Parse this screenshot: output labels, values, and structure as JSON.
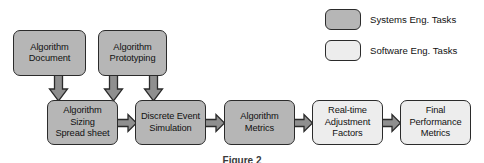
{
  "diagram": {
    "title_caption": "Figure 2",
    "legend": {
      "items": [
        {
          "label": "Systems Eng. Tasks",
          "swatch": "systems",
          "color": "#b6b6b6"
        },
        {
          "label": "Software Eng. Tasks",
          "swatch": "software",
          "color": "#ededed"
        }
      ]
    },
    "nodes": [
      {
        "id": "algorithm-document",
        "label": "Algorithm\nDocument",
        "category": "systems",
        "x": 13,
        "y": 30,
        "w": 73,
        "h": 46
      },
      {
        "id": "algorithm-prototyping",
        "label": "Algorithm\nPrototyping",
        "category": "systems",
        "x": 98,
        "y": 30,
        "w": 69,
        "h": 46
      },
      {
        "id": "algorithm-sizing",
        "label": "Algorithm\nSizing\nSpread sheet",
        "category": "systems",
        "x": 47,
        "y": 100,
        "w": 71,
        "h": 45
      },
      {
        "id": "discrete-event-simulation",
        "label": "Discrete Event\nSimulation",
        "category": "systems",
        "x": 135,
        "y": 100,
        "w": 71,
        "h": 45
      },
      {
        "id": "algorithm-metrics",
        "label": "Algorithm\nMetrics",
        "category": "systems",
        "x": 224,
        "y": 100,
        "w": 71,
        "h": 45
      },
      {
        "id": "real-time-adjustment",
        "label": "Real-time\nAdjustment\nFactors",
        "category": "software",
        "x": 312,
        "y": 100,
        "w": 71,
        "h": 45
      },
      {
        "id": "final-performance",
        "label": "Final\nPerformance\nMetrics",
        "category": "software",
        "x": 400,
        "y": 100,
        "w": 71,
        "h": 45
      }
    ],
    "edges": [
      {
        "id": "document-to-sizing",
        "from": "algorithm-document",
        "to": "algorithm-sizing",
        "direction": "down"
      },
      {
        "id": "prototyping-to-sizing",
        "from": "algorithm-prototyping",
        "to": "algorithm-sizing",
        "direction": "down"
      },
      {
        "id": "prototyping-to-simulation",
        "from": "algorithm-prototyping",
        "to": "discrete-event-simulation",
        "direction": "down"
      },
      {
        "id": "sizing-to-simulation",
        "from": "algorithm-sizing",
        "to": "discrete-event-simulation",
        "direction": "right"
      },
      {
        "id": "simulation-to-metrics",
        "from": "discrete-event-simulation",
        "to": "algorithm-metrics",
        "direction": "right"
      },
      {
        "id": "metrics-to-adjustment",
        "from": "algorithm-metrics",
        "to": "real-time-adjustment",
        "direction": "right"
      },
      {
        "id": "adjustment-to-final-performance",
        "from": "real-time-adjustment",
        "to": "final-performance",
        "direction": "right"
      }
    ]
  }
}
